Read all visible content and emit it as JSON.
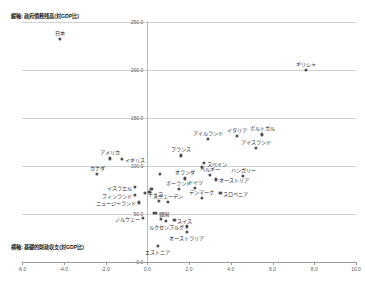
{
  "chart_data": {
    "type": "scatter",
    "title": "",
    "ylabel": "縦軸: 政府債務残高(対GDP比)",
    "xlabel": "横軸: 基礎的財政収支(対GDP比)",
    "xlim": [
      -6.0,
      10.0
    ],
    "ylim": [
      0.0,
      250.0
    ],
    "xticks": [
      "-6.0",
      "-4.0",
      "-2.0",
      "0.0",
      "2.0",
      "4.0",
      "6.0",
      "8.0",
      "10.0"
    ],
    "xtick_values": [
      -6.0,
      -4.0,
      -2.0,
      0.0,
      2.0,
      4.0,
      6.0,
      8.0,
      10.0
    ],
    "yticks": [
      "0.0",
      "50.0",
      "100.0",
      "150.0",
      "200.0",
      "250.0"
    ],
    "ytick_values": [
      0.0,
      50.0,
      100.0,
      150.0,
      200.0,
      250.0
    ],
    "grid": true,
    "legend": "none",
    "points": [
      {
        "label": "日本",
        "x": -4.2,
        "y": 232.0,
        "pos": "above"
      },
      {
        "label": "ギリシャ",
        "x": 7.6,
        "y": 200.0,
        "pos": "above"
      },
      {
        "label": "イタリア",
        "x": 4.3,
        "y": 131.0,
        "pos": "above"
      },
      {
        "label": "ポルトガル",
        "x": 5.5,
        "y": 133.0,
        "pos": "above"
      },
      {
        "label": "アイルランド",
        "x": 2.9,
        "y": 128.0,
        "pos": "above"
      },
      {
        "label": "アイスランド",
        "x": 5.2,
        "y": 119.0,
        "pos": "above"
      },
      {
        "label": "アメリカ",
        "x": -1.8,
        "y": 108.0,
        "pos": "above"
      },
      {
        "label": "イギリス",
        "x": -1.2,
        "y": 107.0,
        "pos": "right"
      },
      {
        "label": "フランス",
        "x": 1.6,
        "y": 111.0,
        "pos": "above"
      },
      {
        "label": "スペイン",
        "x": 2.7,
        "y": 103.0,
        "pos": "right"
      },
      {
        "label": "カナダ",
        "x": -2.4,
        "y": 92.0,
        "pos": "above"
      },
      {
        "label": "オランダ",
        "x": 1.8,
        "y": 87.0,
        "pos": "above"
      },
      {
        "label": "ベルギー",
        "x": 3.0,
        "y": 91.0,
        "pos": "above"
      },
      {
        "label": "ハンガリー",
        "x": 4.6,
        "y": 90.0,
        "pos": "above"
      },
      {
        "label": "オーストリア",
        "x": 3.3,
        "y": 86.0,
        "pos": "right"
      },
      {
        "label": "イスラエル",
        "x": -0.6,
        "y": 78.0,
        "pos": "left"
      },
      {
        "label": "ドイツ",
        "x": 2.3,
        "y": 77.0,
        "pos": "above"
      },
      {
        "label": "ポーランド",
        "x": 1.5,
        "y": 76.0,
        "pos": "above"
      },
      {
        "label": "チェコ",
        "x": -0.1,
        "y": 72.0,
        "pos": "right"
      },
      {
        "label": "スロベニア",
        "x": 3.5,
        "y": 72.0,
        "pos": "right"
      },
      {
        "label": "フィンランド",
        "x": -0.6,
        "y": 70.0,
        "pos": "left"
      },
      {
        "label": "デンマーク",
        "x": 2.6,
        "y": 67.0,
        "pos": "above"
      },
      {
        "label": "スウェーデン",
        "x": 1.0,
        "y": 63.0,
        "pos": "above"
      },
      {
        "label": "ニュージーランド",
        "x": -0.4,
        "y": 62.0,
        "pos": "left"
      },
      {
        "label": "韓国",
        "x": 0.4,
        "y": 51.0,
        "pos": "right"
      },
      {
        "label": "ノルウェー",
        "x": -0.2,
        "y": 46.0,
        "pos": "left"
      },
      {
        "label": "スイス",
        "x": 1.3,
        "y": 44.0,
        "pos": "right"
      },
      {
        "label": "ルクセンブルグ",
        "x": 1.9,
        "y": 37.0,
        "pos": "left"
      },
      {
        "label": "オーストラリア",
        "x": 1.9,
        "y": 31.0,
        "pos": "below"
      },
      {
        "label": "エストニア",
        "x": 0.5,
        "y": 17.0,
        "pos": "below"
      }
    ],
    "extra_points": [
      {
        "x": 0.6,
        "y": 92.0
      },
      {
        "x": 2.6,
        "y": 99.0
      },
      {
        "x": 0.2,
        "y": 76.0
      },
      {
        "x": 0.1,
        "y": 73.0
      },
      {
        "x": 0.55,
        "y": 64.0
      },
      {
        "x": 0.3,
        "y": 51.5
      },
      {
        "x": 0.9,
        "y": 43.0
      },
      {
        "x": 0.65,
        "y": 44.5
      }
    ]
  }
}
